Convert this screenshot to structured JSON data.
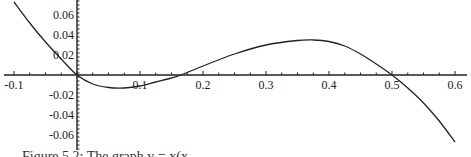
{
  "chart_data": {
    "type": "line",
    "title": "",
    "xlabel": "",
    "ylabel": "",
    "xlim": [
      -0.1,
      0.6
    ],
    "ylim": [
      -0.07,
      0.07
    ],
    "grid": false,
    "x_ticks": [
      -0.1,
      0.1,
      0.2,
      0.3,
      0.4,
      0.5,
      0.6
    ],
    "x_tick_labels": [
      "-0.1",
      "0.1",
      "0.2",
      "0.3",
      "0.4",
      "0.5",
      "0.6"
    ],
    "y_ticks": [
      0.06,
      0.04,
      0.02,
      -0.02,
      -0.04,
      -0.06
    ],
    "y_tick_labels": [
      "0.06",
      "0.04",
      "0.02",
      "-0.02",
      "-0.04",
      "-0.06"
    ],
    "series": [
      {
        "name": "curve",
        "x": [
          -0.1,
          -0.075,
          -0.05,
          -0.025,
          0.0,
          0.025,
          0.05,
          0.075,
          0.1,
          0.125,
          0.15,
          0.165,
          0.2,
          0.25,
          0.3,
          0.35,
          0.375,
          0.4,
          0.425,
          0.45,
          0.475,
          0.5,
          0.525,
          0.55,
          0.575,
          0.6
        ],
        "values": [
          0.073,
          0.052,
          0.033,
          0.016,
          0.0,
          -0.009,
          -0.0125,
          -0.013,
          -0.011,
          -0.007,
          -0.003,
          0.0,
          0.009,
          0.021,
          0.03,
          0.0345,
          0.035,
          0.0335,
          0.029,
          0.021,
          0.011,
          0.0,
          -0.013,
          -0.028,
          -0.046,
          -0.067
        ]
      }
    ],
    "annotations": []
  },
  "caption": "Figure 5.2: The graph y = x(x..."
}
